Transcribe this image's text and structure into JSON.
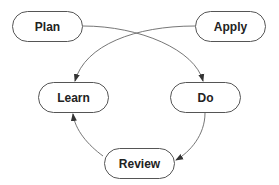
{
  "diagram": {
    "type": "flow",
    "nodes": [
      {
        "id": "plan",
        "label": "Plan",
        "x": 12,
        "y": 11,
        "w": 71,
        "h": 31
      },
      {
        "id": "apply",
        "label": "Apply",
        "x": 195,
        "y": 11,
        "w": 71,
        "h": 31
      },
      {
        "id": "learn",
        "label": "Learn",
        "x": 38,
        "y": 82,
        "w": 71,
        "h": 31
      },
      {
        "id": "do",
        "label": "Do",
        "x": 170,
        "y": 82,
        "w": 71,
        "h": 31
      },
      {
        "id": "review",
        "label": "Review",
        "x": 104,
        "y": 148,
        "w": 71,
        "h": 31
      }
    ],
    "edges": [
      {
        "from": "plan",
        "to": "do"
      },
      {
        "from": "apply",
        "to": "learn"
      },
      {
        "from": "do",
        "to": "review"
      },
      {
        "from": "review",
        "to": "learn"
      }
    ],
    "colors": {
      "stroke": "#555555",
      "text": "#222222",
      "background": "#ffffff"
    }
  }
}
